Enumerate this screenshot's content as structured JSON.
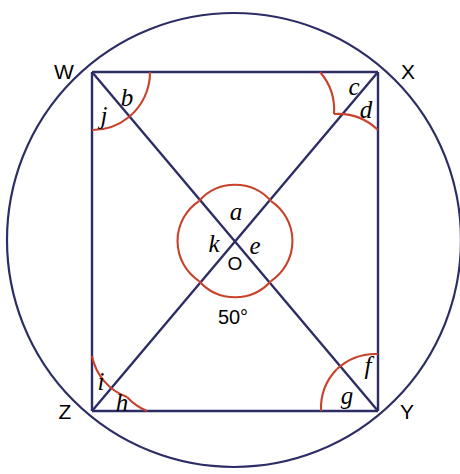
{
  "figure": {
    "type": "circle-geometry-diagram",
    "colors": {
      "line": "#2d2d66",
      "arc": "#c8412a",
      "text": "#000000",
      "background": "#ffffff"
    },
    "canvas": {
      "width": 460,
      "height": 474
    }
  },
  "circle": {
    "centre_label": "O",
    "cx": 234,
    "cy": 240,
    "r": 227
  },
  "vertices": [
    {
      "id": "W",
      "label": "W",
      "x": 92,
      "y": 72,
      "label_x": 64,
      "label_y": 76
    },
    {
      "id": "X",
      "label": "X",
      "x": 378,
      "y": 72,
      "label_x": 408,
      "label_y": 76
    },
    {
      "id": "Y",
      "label": "Y",
      "x": 378,
      "y": 411,
      "label_x": 406,
      "label_y": 418
    },
    {
      "id": "Z",
      "label": "Z",
      "x": 92,
      "y": 411,
      "label_x": 66,
      "label_y": 418
    }
  ],
  "centre_point": {
    "label": "O",
    "x": 235,
    "y": 262
  },
  "known_angle": {
    "label": "50°",
    "value": 50,
    "unit": "degrees",
    "x": 233,
    "y": 324,
    "at": "angle ZOY at centre, below intersection"
  },
  "angle_labels": [
    {
      "id": "a",
      "label": "a",
      "x": 235,
      "y": 212,
      "location": "above O, angle WOX"
    },
    {
      "id": "b",
      "label": "b",
      "x": 127,
      "y": 99,
      "location": "at W, between WX and WY"
    },
    {
      "id": "c",
      "label": "c",
      "x": 354,
      "y": 88,
      "location": "at X, between XW and XZ"
    },
    {
      "id": "d",
      "label": "d",
      "x": 365,
      "y": 110,
      "location": "at X, between XZ and XY"
    },
    {
      "id": "e",
      "label": "e",
      "x": 254,
      "y": 247,
      "location": "right of O, angle XOY"
    },
    {
      "id": "f",
      "label": "f",
      "x": 367,
      "y": 367,
      "location": "at Y, between YW and YX"
    },
    {
      "id": "g",
      "label": "g",
      "x": 347,
      "y": 396,
      "location": "at Y, between YZ and YW"
    },
    {
      "id": "h",
      "label": "h",
      "x": 122,
      "y": 404,
      "location": "at Z, between ZX and ZY"
    },
    {
      "id": "i",
      "label": "i",
      "x": 101,
      "y": 383,
      "location": "at Z, between ZW and ZX"
    },
    {
      "id": "j",
      "label": "j",
      "x": 104,
      "y": 116,
      "location": "at W, between WZ and WY"
    },
    {
      "id": "k",
      "label": "k",
      "x": 214,
      "y": 245,
      "location": "left of O, angle WOZ"
    }
  ],
  "segments": [
    {
      "name": "side-WX",
      "from": "W",
      "to": "X"
    },
    {
      "name": "side-XY",
      "from": "X",
      "to": "Y"
    },
    {
      "name": "side-YZ",
      "from": "Y",
      "to": "Z"
    },
    {
      "name": "side-ZW",
      "from": "Z",
      "to": "W"
    },
    {
      "name": "diagonal-WY",
      "from": "W",
      "to": "Y"
    },
    {
      "name": "diagonal-XZ",
      "from": "X",
      "to": "Z"
    }
  ]
}
